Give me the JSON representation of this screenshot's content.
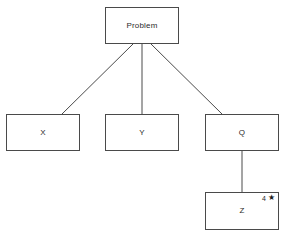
{
  "diagram": {
    "background_color": "#ffffff",
    "line_color": "#4a4a4a",
    "text_color": "#2b2b2b",
    "nodes": [
      {
        "id": "problem",
        "label": "Problem"
      },
      {
        "id": "x",
        "label": "X"
      },
      {
        "id": "y",
        "label": "Y"
      },
      {
        "id": "q",
        "label": "Q"
      },
      {
        "id": "z",
        "label": "Z"
      }
    ],
    "annotations": {
      "z_badge_number": "4",
      "z_badge_icon": "star-icon",
      "z_badge_glyph": "★"
    },
    "edges": [
      {
        "from": "problem",
        "to": "x"
      },
      {
        "from": "problem",
        "to": "y"
      },
      {
        "from": "problem",
        "to": "q"
      },
      {
        "from": "q",
        "to": "z"
      }
    ]
  }
}
